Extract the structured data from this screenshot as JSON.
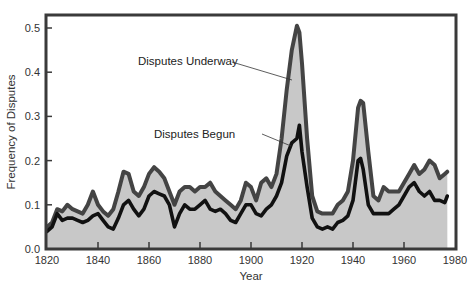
{
  "chart_data": {
    "type": "line",
    "title": "",
    "xlabel": "Year",
    "ylabel": "Frequency of Disputes",
    "xlim": [
      1820,
      1980
    ],
    "ylim": [
      0.0,
      0.53
    ],
    "xticks": [
      "1820",
      "1840",
      "1860",
      "1880",
      "1900",
      "1920",
      "1940",
      "1960",
      "1980"
    ],
    "yticks": [
      "0.0",
      "0.1",
      "0.2",
      "0.3",
      "0.4",
      "0.5"
    ],
    "grid": false,
    "legend": "inline annotations with leader lines",
    "colors": {
      "underway": "#444444",
      "begun": "#111111",
      "fill": "#c8c8c8",
      "frame": "#3a3a3a"
    },
    "x": [
      1820,
      1822,
      1824,
      1826,
      1828,
      1830,
      1832,
      1834,
      1836,
      1838,
      1840,
      1842,
      1844,
      1846,
      1848,
      1850,
      1852,
      1854,
      1856,
      1858,
      1860,
      1862,
      1864,
      1866,
      1868,
      1870,
      1872,
      1874,
      1876,
      1878,
      1880,
      1882,
      1884,
      1886,
      1888,
      1890,
      1892,
      1894,
      1896,
      1898,
      1900,
      1902,
      1904,
      1906,
      1908,
      1910,
      1912,
      1914,
      1916,
      1918,
      1919,
      1920,
      1922,
      1924,
      1926,
      1928,
      1930,
      1932,
      1934,
      1936,
      1938,
      1940,
      1942,
      1943,
      1944,
      1946,
      1948,
      1950,
      1952,
      1954,
      1956,
      1958,
      1960,
      1962,
      1964,
      1966,
      1968,
      1970,
      1972,
      1974,
      1976,
      1977
    ],
    "series": [
      {
        "name": "Disputes Underway",
        "values": [
          0.05,
          0.06,
          0.09,
          0.085,
          0.1,
          0.09,
          0.085,
          0.08,
          0.1,
          0.13,
          0.1,
          0.085,
          0.075,
          0.09,
          0.13,
          0.175,
          0.17,
          0.13,
          0.12,
          0.14,
          0.17,
          0.185,
          0.175,
          0.16,
          0.13,
          0.1,
          0.13,
          0.14,
          0.14,
          0.13,
          0.14,
          0.14,
          0.15,
          0.13,
          0.12,
          0.11,
          0.1,
          0.09,
          0.11,
          0.15,
          0.14,
          0.11,
          0.15,
          0.16,
          0.14,
          0.17,
          0.25,
          0.36,
          0.45,
          0.505,
          0.49,
          0.42,
          0.25,
          0.12,
          0.085,
          0.08,
          0.08,
          0.08,
          0.1,
          0.11,
          0.13,
          0.2,
          0.32,
          0.335,
          0.33,
          0.22,
          0.12,
          0.11,
          0.14,
          0.13,
          0.13,
          0.13,
          0.15,
          0.17,
          0.19,
          0.17,
          0.18,
          0.2,
          0.19,
          0.16,
          0.17,
          0.175
        ]
      },
      {
        "name": "Disputes Begun",
        "values": [
          0.04,
          0.05,
          0.08,
          0.065,
          0.07,
          0.07,
          0.065,
          0.06,
          0.065,
          0.075,
          0.08,
          0.065,
          0.05,
          0.045,
          0.07,
          0.1,
          0.11,
          0.09,
          0.075,
          0.09,
          0.12,
          0.13,
          0.125,
          0.12,
          0.1,
          0.05,
          0.08,
          0.1,
          0.09,
          0.09,
          0.1,
          0.11,
          0.09,
          0.085,
          0.09,
          0.08,
          0.065,
          0.06,
          0.08,
          0.1,
          0.1,
          0.08,
          0.075,
          0.09,
          0.1,
          0.12,
          0.15,
          0.21,
          0.24,
          0.25,
          0.28,
          0.22,
          0.14,
          0.07,
          0.05,
          0.045,
          0.05,
          0.045,
          0.06,
          0.065,
          0.075,
          0.11,
          0.2,
          0.205,
          0.18,
          0.1,
          0.08,
          0.08,
          0.08,
          0.08,
          0.09,
          0.1,
          0.12,
          0.14,
          0.15,
          0.13,
          0.12,
          0.13,
          0.11,
          0.11,
          0.105,
          0.12
        ]
      }
    ],
    "annotations": [
      {
        "text": "Disputes Underway",
        "points_to": "Disputes Underway near 1918"
      },
      {
        "text": "Disputes Begun",
        "points_to": "Disputes Begun near 1916"
      }
    ]
  },
  "labels": {
    "ylabel": "Frequency of Disputes",
    "xlabel": "Year",
    "annot_underway": "Disputes Underway",
    "annot_begun": "Disputes Begun"
  }
}
